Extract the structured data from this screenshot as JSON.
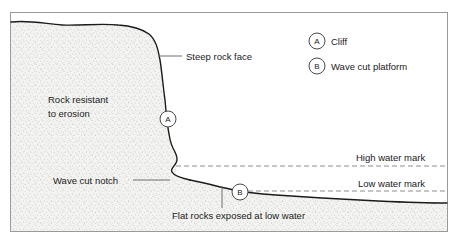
{
  "diagram": {
    "frame": {
      "stroke": "#9a9a9a"
    },
    "colors": {
      "ink": "#1b1b1b",
      "leader": "#6f6f6f",
      "stipple": "#8c8c8c",
      "rock_fill": "#f2f2f0",
      "dashed": "#8e8e8e",
      "frame": "#9a9a9a",
      "background": "#ffffff"
    },
    "labels": {
      "steep_rock_face": "Steep rock face",
      "rock_resistant_line1": "Rock resistant",
      "rock_resistant_line2": "to erosion",
      "wave_cut_notch": "Wave cut notch",
      "flat_rocks": "Flat rocks exposed at low water",
      "high_water_mark": "High water mark",
      "low_water_mark": "Low water mark"
    },
    "markers": [
      {
        "id": "marker-a",
        "letter": "A",
        "cx": 168,
        "cy": 119,
        "r": 8
      },
      {
        "id": "marker-b",
        "letter": "B",
        "cx": 240,
        "cy": 192,
        "r": 8
      }
    ],
    "key": {
      "items": [
        {
          "letter": "A",
          "label": "Cliff"
        },
        {
          "letter": "B",
          "label": "Wave cut platform"
        }
      ]
    }
  }
}
